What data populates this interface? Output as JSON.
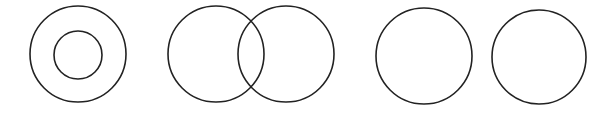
{
  "diagram": {
    "title": "",
    "stroke_color": "#222222",
    "background": "#ffffff",
    "groups": [
      {
        "name": "concentric",
        "relation": "containment",
        "circles": [
          {
            "cx": 78,
            "cy": 54,
            "r": 48
          },
          {
            "cx": 78,
            "cy": 55,
            "r": 24
          }
        ]
      },
      {
        "name": "overlapping",
        "relation": "intersection",
        "circles": [
          {
            "cx": 216,
            "cy": 54,
            "r": 48
          },
          {
            "cx": 286,
            "cy": 54,
            "r": 48
          }
        ]
      },
      {
        "name": "disjoint",
        "relation": "separate",
        "circles": [
          {
            "cx": 424,
            "cy": 56,
            "r": 48
          },
          {
            "cx": 539,
            "cy": 57,
            "r": 47
          }
        ]
      }
    ]
  }
}
